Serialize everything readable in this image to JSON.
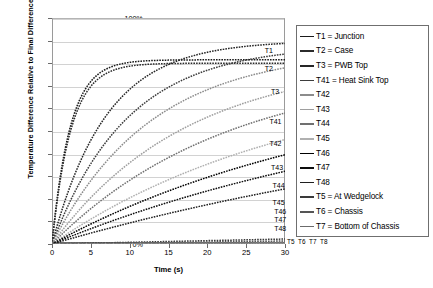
{
  "chart_data": {
    "type": "line",
    "title": "",
    "xlabel": "Time (s)",
    "ylabel": "Temperature Difference Relative to Final Difference",
    "xlim": [
      0,
      30
    ],
    "ylim": [
      0,
      1.0
    ],
    "grid": true,
    "legend_position": "right",
    "xticks": [
      "0",
      "5",
      "10",
      "15",
      "20",
      "25",
      "30"
    ],
    "yticks": [
      "0%",
      "10%",
      "20%",
      "30%",
      "40%",
      "50%",
      "60%",
      "70%",
      "80%",
      "90%",
      "100%"
    ],
    "x": [
      0,
      1,
      2,
      3,
      4,
      5,
      6,
      7,
      8,
      9,
      10,
      12,
      14,
      16,
      18,
      20,
      22,
      24,
      26,
      28
    ],
    "series": [
      {
        "name": "T1",
        "legend": "T1 = Junction",
        "color": "#1a1a1a",
        "end_label": "T1",
        "tau": 7.0,
        "amp": 0.815,
        "values": [
          0,
          0.109,
          0.205,
          0.289,
          0.363,
          0.428,
          0.485,
          0.535,
          0.579,
          0.617,
          0.651,
          0.707,
          0.749,
          0.781,
          0.805,
          0.823,
          0.837,
          0.847,
          0.855,
          0.861
        ]
      },
      {
        "name": "T2",
        "legend": "T2 = Case",
        "color": "#2b2b2b",
        "end_label": "T2",
        "tau": 7.3,
        "amp": 0.8,
        "values": [
          0,
          0.102,
          0.194,
          0.274,
          0.345,
          0.407,
          0.462,
          0.511,
          0.553,
          0.591,
          0.624,
          0.679,
          0.721,
          0.753,
          0.777,
          0.796,
          0.81,
          0.821,
          0.829,
          0.836
        ]
      },
      {
        "name": "T3",
        "legend": "T3 = PWB Top",
        "color": "#262626",
        "end_label": "T3",
        "tau": 21.0,
        "amp": 0.9,
        "values": [
          0,
          0.042,
          0.082,
          0.12,
          0.157,
          0.192,
          0.226,
          0.258,
          0.289,
          0.318,
          0.347,
          0.4,
          0.449,
          0.493,
          0.534,
          0.571,
          0.605,
          0.636,
          0.664,
          0.69
        ]
      },
      {
        "name": "T41",
        "legend": "T41 = Heat Sink Top",
        "color": "#3d3d3d",
        "end_label": "T41",
        "tau": 29.0,
        "amp": 0.88,
        "values": [
          0,
          0.03,
          0.059,
          0.087,
          0.115,
          0.141,
          0.167,
          0.192,
          0.216,
          0.24,
          0.263,
          0.306,
          0.347,
          0.385,
          0.42,
          0.453,
          0.483,
          0.511,
          0.537,
          0.561
        ]
      },
      {
        "name": "T42",
        "legend": "T42",
        "color": "#8c8c8c",
        "end_label": "T42",
        "tau": 38.0,
        "amp": 0.86,
        "values": [
          0,
          0.022,
          0.044,
          0.066,
          0.087,
          0.108,
          0.128,
          0.148,
          0.167,
          0.186,
          0.205,
          0.24,
          0.274,
          0.306,
          0.336,
          0.365,
          0.392,
          0.418,
          0.442,
          0.464
        ]
      },
      {
        "name": "T43",
        "legend": "T43",
        "color": "#9e9e9e",
        "end_label": "T43",
        "tau": 52.0,
        "amp": 0.82,
        "values": [
          0,
          0.016,
          0.031,
          0.046,
          0.061,
          0.076,
          0.091,
          0.105,
          0.119,
          0.133,
          0.147,
          0.174,
          0.2,
          0.225,
          0.249,
          0.272,
          0.294,
          0.316,
          0.336,
          0.356
        ]
      },
      {
        "name": "T44",
        "legend": "T44",
        "color": "#707070",
        "end_label": "T44",
        "tau": 68.0,
        "amp": 0.79,
        "values": [
          0,
          0.012,
          0.023,
          0.034,
          0.045,
          0.056,
          0.067,
          0.078,
          0.089,
          0.099,
          0.11,
          0.131,
          0.151,
          0.171,
          0.19,
          0.209,
          0.227,
          0.245,
          0.262,
          0.279
        ]
      },
      {
        "name": "T45",
        "legend": "T45",
        "color": "#b0b0b0",
        "end_label": "T45",
        "tau": 96.0,
        "amp": 0.76,
        "values": [
          0,
          0.008,
          0.016,
          0.024,
          0.032,
          0.039,
          0.047,
          0.055,
          0.062,
          0.07,
          0.077,
          0.092,
          0.107,
          0.121,
          0.135,
          0.149,
          0.163,
          0.176,
          0.189,
          0.202
        ]
      },
      {
        "name": "T46",
        "legend": "T46",
        "color": "#000000",
        "end_label": "T46",
        "tau": 118.0,
        "amp": 0.74,
        "values": [
          0,
          0.006,
          0.013,
          0.019,
          0.025,
          0.032,
          0.038,
          0.044,
          0.05,
          0.056,
          0.062,
          0.074,
          0.086,
          0.098,
          0.11,
          0.121,
          0.132,
          0.143,
          0.154,
          0.164
        ]
      },
      {
        "name": "T47",
        "legend": "T47",
        "color": "#0d0d0d",
        "end_label": "T47",
        "tau": 152.0,
        "amp": 0.72,
        "values": [
          0,
          0.005,
          0.01,
          0.015,
          0.02,
          0.025,
          0.03,
          0.035,
          0.039,
          0.044,
          0.049,
          0.058,
          0.068,
          0.077,
          0.086,
          0.095,
          0.104,
          0.113,
          0.122,
          0.131
        ]
      },
      {
        "name": "T48",
        "legend": "T48",
        "color": "#1f1f1f",
        "end_label": "T48",
        "tau": 210.0,
        "amp": 0.7,
        "values": [
          0,
          0.003,
          0.007,
          0.01,
          0.014,
          0.017,
          0.021,
          0.024,
          0.028,
          0.031,
          0.034,
          0.041,
          0.048,
          0.055,
          0.061,
          0.068,
          0.074,
          0.081,
          0.087,
          0.094
        ]
      },
      {
        "name": "T5",
        "legend": "T5 = At Wedgelock",
        "color": "#3a3a3a",
        "end_label": "T5",
        "tau": 2400.0,
        "amp": 0.6,
        "values": [
          0,
          0.0003,
          0.0005,
          0.0008,
          0.001,
          0.0013,
          0.0015,
          0.0018,
          0.002,
          0.0023,
          0.0025,
          0.003,
          0.0035,
          0.004,
          0.0045,
          0.005,
          0.0055,
          0.006,
          0.0065,
          0.007
        ]
      },
      {
        "name": "T6",
        "legend": "T6 = Chassis",
        "color": "#555555",
        "end_label": "T6",
        "tau": 4000.0,
        "amp": 0.6,
        "values": [
          0,
          0.0002,
          0.0003,
          0.0005,
          0.0006,
          0.0008,
          0.0009,
          0.0011,
          0.0012,
          0.0014,
          0.0015,
          0.0018,
          0.0021,
          0.0024,
          0.0027,
          0.003,
          0.0033,
          0.0036,
          0.0039,
          0.0042
        ]
      },
      {
        "name": "T7",
        "legend": "T7 = Bottom of Chassis",
        "color": "#6b6b6b",
        "end_label": "T7",
        "tau": 7000.0,
        "amp": 0.6,
        "values": [
          0,
          0.0001,
          0.0002,
          0.0003,
          0.0003,
          0.0004,
          0.0005,
          0.0006,
          0.0007,
          0.0008,
          0.0009,
          0.001,
          0.0012,
          0.0014,
          0.0015,
          0.0017,
          0.0019,
          0.0021,
          0.0022,
          0.0024
        ]
      },
      {
        "name": "T8",
        "legend": "T8",
        "color": "#808080",
        "end_label": "T8",
        "tau": 12000.0,
        "amp": 0.6,
        "values": [
          0,
          5e-05,
          0.0001,
          0.00015,
          0.0002,
          0.00025,
          0.0003,
          0.00035,
          0.0004,
          0.00045,
          0.0005,
          0.0006,
          0.0007,
          0.0008,
          0.0009,
          0.001,
          0.0011,
          0.0012,
          0.0013,
          0.0014
        ]
      }
    ],
    "inline_labels": [
      {
        "text": "T1",
        "x": 27.4,
        "y": 0.855
      },
      {
        "text": "T2",
        "x": 27.4,
        "y": 0.775
      },
      {
        "text": "T3",
        "x": 28.2,
        "y": 0.672
      },
      {
        "text": "T41",
        "x": 28.0,
        "y": 0.54
      },
      {
        "text": "T42",
        "x": 28.0,
        "y": 0.442
      },
      {
        "text": "T43",
        "x": 28.2,
        "y": 0.335
      },
      {
        "text": "T44",
        "x": 28.4,
        "y": 0.258
      },
      {
        "text": "T45",
        "x": 28.4,
        "y": 0.182
      },
      {
        "text": "T46",
        "x": 28.6,
        "y": 0.14
      },
      {
        "text": "T47",
        "x": 28.6,
        "y": 0.104
      },
      {
        "text": "T48",
        "x": 28.6,
        "y": 0.068
      }
    ],
    "axis_end_labels": [
      "T5",
      "T6",
      "T7",
      "T8"
    ]
  }
}
